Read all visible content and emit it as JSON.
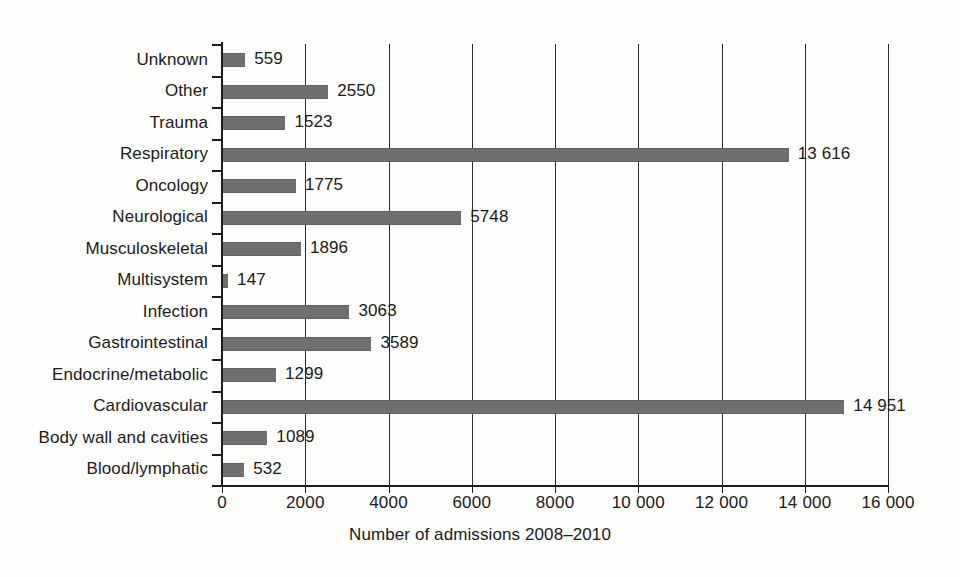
{
  "chart_data": {
    "type": "bar",
    "orientation": "horizontal",
    "title": "",
    "xlabel": "Number of admissions 2008–2010",
    "ylabel": "",
    "xlim": [
      0,
      16000
    ],
    "grid": true,
    "legend": false,
    "categories": [
      "Unknown",
      "Other",
      "Trauma",
      "Respiratory",
      "Oncology",
      "Neurological",
      "Musculoskeletal",
      "Multisystem",
      "Infection",
      "Gastrointestinal",
      "Endocrine/metabolic",
      "Cardiovascular",
      "Body wall and cavities",
      "Blood/lymphatic"
    ],
    "values": [
      559,
      2550,
      1523,
      13616,
      1775,
      5748,
      1896,
      147,
      3063,
      3589,
      1299,
      14951,
      1089,
      532
    ],
    "value_labels": [
      "559",
      "2550",
      "1523",
      "13 616",
      "1775",
      "5748",
      "1896",
      "147",
      "3063",
      "3589",
      "1299",
      "14 951",
      "1089",
      "532"
    ],
    "xticks": [
      0,
      2000,
      4000,
      6000,
      8000,
      10000,
      12000,
      14000,
      16000
    ],
    "xtick_labels": [
      "0",
      "2000",
      "4000",
      "6000",
      "8000",
      "10 000",
      "12 000",
      "14 000",
      "16 000"
    ],
    "bar_color": "#6f6f6f",
    "axis_color": "#1c1c1c",
    "grid_color": "#2b2b2b",
    "background_color": "#fdfdfb"
  }
}
